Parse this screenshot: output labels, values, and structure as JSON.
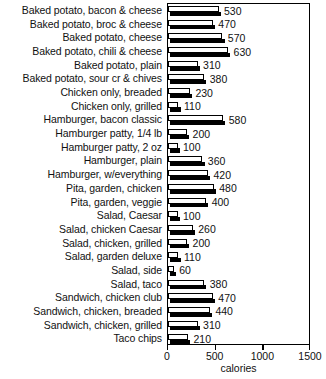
{
  "chart_data": {
    "type": "bar",
    "orientation": "horizontal",
    "title": "",
    "xlabel": "calories",
    "ylabel": "",
    "xlim": [
      0,
      1500
    ],
    "xticks": [
      0,
      500,
      1000,
      1500
    ],
    "xtick_labels": [
      "0",
      "500",
      "1000",
      "1500"
    ],
    "grid": false,
    "legend": null,
    "categories": [
      "Baked potato, bacon & cheese",
      "Baked potato, broc & cheese",
      "Baked potato, cheese",
      "Baked potato, chili & cheese",
      "Baked potato, plain",
      "Baked potato, sour cr & chives",
      "Chicken only, breaded",
      "Chicken only, grilled",
      "Hamburger, bacon classic",
      "Hamburger patty, 1/4 lb",
      "Hamburger patty, 2 oz",
      "Hamburger, plain",
      "Hamburger, w/everything",
      "Pita, garden, chicken",
      "Pita, garden, veggie",
      "Salad, Caesar",
      "Salad, chicken Caesar",
      "Salad, chicken, grilled",
      "Salad, garden deluxe",
      "Salad, side",
      "Salad, taco",
      "Sandwich, chicken club",
      "Sandwich, chicken, breaded",
      "Sandwich, chicken, grilled",
      "Taco chips"
    ],
    "values": [
      530,
      470,
      570,
      630,
      310,
      380,
      230,
      110,
      580,
      200,
      100,
      360,
      420,
      480,
      400,
      100,
      260,
      200,
      110,
      60,
      380,
      470,
      440,
      310,
      210
    ],
    "data_labels": [
      "530",
      "470",
      "570",
      "630",
      "310",
      "380",
      "230",
      "110",
      "580",
      "200",
      "100",
      "360",
      "420",
      "480",
      "400",
      "100",
      "260",
      "200",
      "110",
      "60",
      "380",
      "470",
      "440",
      "310",
      "210"
    ],
    "colors": {
      "bar_face": "#ffffff",
      "bar_outline": "#000000",
      "bar_shadow": "#000000",
      "axis": "#000000",
      "text": "#111111",
      "background": "#ffffff"
    }
  },
  "axis": {
    "xlabel": "calories"
  }
}
